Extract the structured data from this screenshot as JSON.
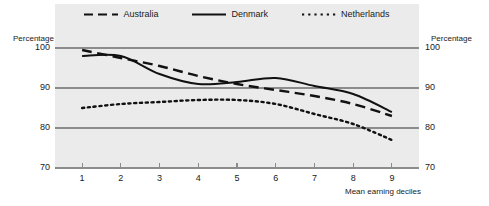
{
  "chart_data": {
    "type": "line",
    "title": "",
    "subtitle": "",
    "xlabel": "Mean earning deciles",
    "ylabel": "Percentage",
    "ylabel_right": "Percentage",
    "categories": [
      "1",
      "2",
      "3",
      "4",
      "5",
      "6",
      "7",
      "8",
      "9"
    ],
    "x": [
      1,
      2,
      3,
      4,
      5,
      6,
      7,
      8,
      9
    ],
    "xlim": [
      0.3,
      9.7
    ],
    "ylim": [
      70,
      100
    ],
    "xticks": [
      "1",
      "2",
      "3",
      "4",
      "5",
      "6",
      "7",
      "8",
      "9"
    ],
    "yticks": [
      "70",
      "80",
      "90",
      "100"
    ],
    "grid": true,
    "legend_position": "top-center",
    "series": [
      {
        "name": "Australia",
        "style": "dashed",
        "color": "#111111",
        "values": [
          99.5,
          97.5,
          95.5,
          93.0,
          91.0,
          89.5,
          88.0,
          86.0,
          83.0
        ]
      },
      {
        "name": "Denmark",
        "style": "solid",
        "color": "#111111",
        "values": [
          98.0,
          98.0,
          93.5,
          91.0,
          91.5,
          92.5,
          90.5,
          88.5,
          84.0
        ]
      },
      {
        "name": "Netherlands",
        "style": "dotted",
        "color": "#111111",
        "values": [
          85.0,
          86.0,
          86.5,
          87.0,
          87.0,
          86.0,
          83.5,
          81.0,
          77.0
        ]
      }
    ]
  },
  "legend": {
    "items": [
      {
        "label": "Australia"
      },
      {
        "label": "Denmark"
      },
      {
        "label": "Netherlands"
      }
    ]
  },
  "axes": {
    "left_title": "Percentage",
    "right_title": "Percentage",
    "x_title": "Mean earning deciles"
  },
  "colors": {
    "plot_background": "#ebebeb",
    "page_background": "#ffffff",
    "gridline": "#8c8c8c",
    "line": "#111111",
    "text": "#1a1a1a"
  }
}
